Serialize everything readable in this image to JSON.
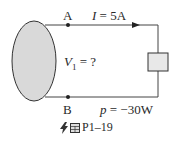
{
  "diagram": {
    "node_a": {
      "label": "A"
    },
    "node_b": {
      "label": "B"
    },
    "current": {
      "var": "I",
      "text": " = 5A"
    },
    "voltage": {
      "var": "V",
      "sub": "1",
      "text": " = ?"
    },
    "power": {
      "var": "p",
      "text": " = −30W"
    },
    "caption": {
      "label": "P1–19",
      "icons": [
        "lightning-icon",
        "grid-icon"
      ]
    },
    "colors": {
      "source_fill": "#d9d9d9",
      "load_fill": "#e8e8e8",
      "wire": "#444444"
    }
  }
}
